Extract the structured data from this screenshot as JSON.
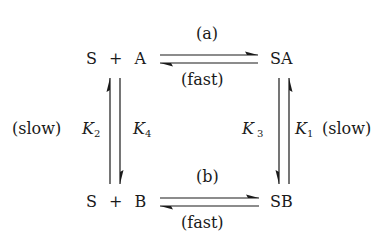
{
  "species": {
    "top_left": "S + A",
    "top_right": "SA",
    "bottom_left": "S + B",
    "bottom_right": "SB"
  },
  "reactions": {
    "top": {
      "label_above": "(a)",
      "label_below": "(fast)"
    },
    "bottom": {
      "label_above": "(b)",
      "label_below": "(fast)"
    },
    "left": {
      "rate_label": "(slow)",
      "k_outer": "K",
      "k_outer_sub": "2",
      "k_inner": "K",
      "k_inner_sub": "4"
    },
    "right": {
      "rate_label": "(slow)",
      "k_inner": "K",
      "k_inner_sub": "3",
      "k_outer": "K",
      "k_outer_sub": "1"
    }
  },
  "colors": {
    "ink": "#1a1a1a",
    "background": "#ffffff"
  }
}
